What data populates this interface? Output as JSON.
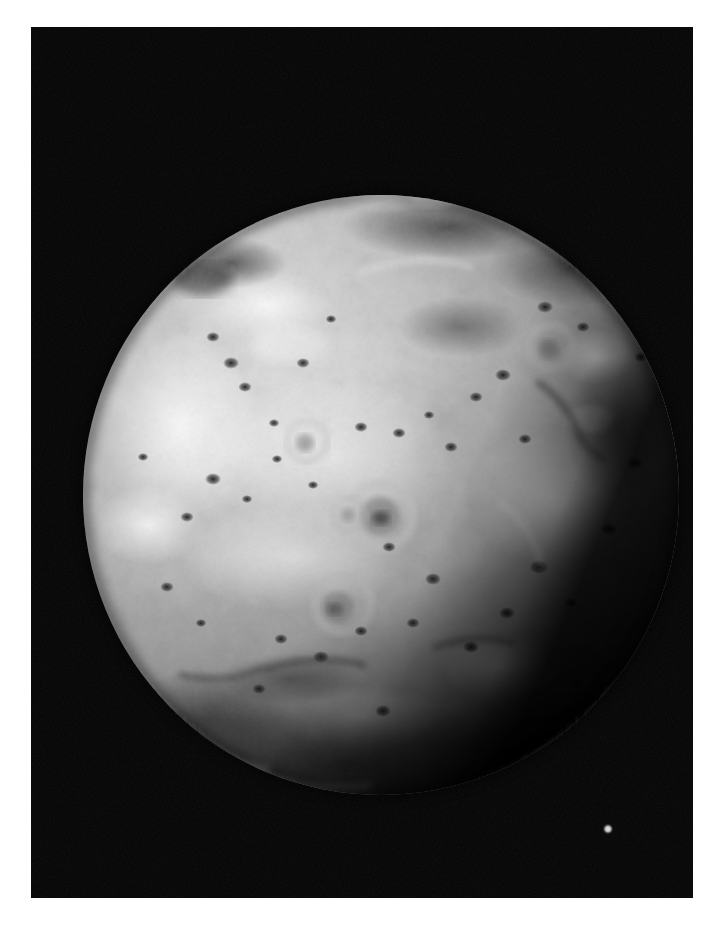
{
  "page": {
    "background_color": "#ffffff",
    "width": 722,
    "height": 926
  },
  "photo": {
    "name": "io-volcanic-moon-photograph",
    "kind": "grayscale-spacecraft-image",
    "frame": {
      "x": 31,
      "y": 27,
      "width": 662,
      "height": 871
    },
    "background_color": "#050505",
    "subject": "Io",
    "alt_text": "Grayscale spacecraft photograph of Jupiter's moon Io against black space"
  },
  "body": {
    "name": "io-disk",
    "center_x": 350,
    "center_y": 468,
    "radius_x": 298,
    "radius_y": 300,
    "base_color": "#b9b9b9",
    "highlight_color": "#e9e9e9",
    "midtone_color": "#9a9a9a",
    "shadow_color": "#3a3a3a",
    "limb_color": "#171717"
  },
  "features": {
    "bright_patches": [
      {
        "name": "north-polar-bright-patch",
        "cx": 352,
        "cy": 165,
        "rx": 42,
        "ry": 17,
        "tone": "#efefef"
      },
      {
        "name": "northwest-bright-plain",
        "cx": 236,
        "cy": 278,
        "rx": 58,
        "ry": 30,
        "tone": "#e6e6e6"
      },
      {
        "name": "west-bright-terrain",
        "cx": 150,
        "cy": 400,
        "rx": 70,
        "ry": 85,
        "tone": "#e4e4e4"
      },
      {
        "name": "west-bright-streak",
        "cx": 120,
        "cy": 498,
        "rx": 46,
        "ry": 34,
        "tone": "#e8e8e8"
      },
      {
        "name": "central-bright-plain",
        "cx": 300,
        "cy": 430,
        "rx": 120,
        "ry": 70,
        "tone": "#dedede"
      },
      {
        "name": "central-lower-bright",
        "cx": 262,
        "cy": 530,
        "rx": 108,
        "ry": 48,
        "tone": "#dcdcdc"
      },
      {
        "name": "east-bright-region",
        "cx": 520,
        "cy": 470,
        "rx": 72,
        "ry": 62,
        "tone": "#e2e2e2"
      },
      {
        "name": "east-bright-spur",
        "cx": 565,
        "cy": 330,
        "rx": 30,
        "ry": 24,
        "tone": "#e0e0e0"
      },
      {
        "name": "southeast-bright-patch",
        "cx": 470,
        "cy": 640,
        "rx": 52,
        "ry": 30,
        "tone": "#d8d8d8"
      },
      {
        "name": "south-bright-rim",
        "cx": 330,
        "cy": 690,
        "rx": 76,
        "ry": 28,
        "tone": "#cccccc"
      }
    ],
    "dark_patches": [
      {
        "name": "northwest-dark-terrain",
        "cx": 200,
        "cy": 236,
        "rx": 48,
        "ry": 22,
        "tone": "#3c3c3c"
      },
      {
        "name": "north-dark-band",
        "cx": 420,
        "cy": 200,
        "rx": 96,
        "ry": 26,
        "tone": "#585858"
      },
      {
        "name": "northeast-dark-mottling",
        "cx": 540,
        "cy": 240,
        "rx": 70,
        "ry": 34,
        "tone": "#4e4e4e"
      },
      {
        "name": "east-dark-band",
        "cx": 585,
        "cy": 400,
        "rx": 44,
        "ry": 60,
        "tone": "#555555"
      },
      {
        "name": "south-terminator-shading",
        "cx": 320,
        "cy": 730,
        "rx": 180,
        "ry": 60,
        "tone": "#2a2a2a"
      },
      {
        "name": "southeast-dark-shading",
        "cx": 500,
        "cy": 720,
        "rx": 110,
        "ry": 50,
        "tone": "#3a3a3a"
      },
      {
        "name": "southwest-dark-shading",
        "cx": 175,
        "cy": 690,
        "rx": 80,
        "ry": 46,
        "tone": "#4a4a4a"
      }
    ],
    "volcanic_rings": [
      {
        "name": "prometheus-ring",
        "cx": 349,
        "cy": 489,
        "r_outer": 32,
        "r_inner": 17,
        "ring_tone": "#d2d2d2",
        "core_tone": "#5e5e5e"
      },
      {
        "name": "secondary-ring-southwest",
        "cx": 312,
        "cy": 577,
        "r_outer": 28,
        "r_inner": 14,
        "ring_tone": "#cacaca",
        "core_tone": "#6a6a6a"
      },
      {
        "name": "ring-northwest",
        "cx": 276,
        "cy": 414,
        "r_outer": 20,
        "r_inner": 9,
        "ring_tone": "#c8c8c8",
        "core_tone": "#777777"
      },
      {
        "name": "ring-east",
        "cx": 520,
        "cy": 320,
        "r_outer": 22,
        "r_inner": 10,
        "ring_tone": "#c6c6c6",
        "core_tone": "#6f6f6f"
      },
      {
        "name": "ring-southcentral",
        "cx": 318,
        "cy": 487,
        "r_outer": 16,
        "r_inner": 7,
        "ring_tone": "#c4c4c4",
        "core_tone": "#7c7c7c"
      }
    ],
    "dark_spots": [
      {
        "cx": 200,
        "cy": 336,
        "r": 6
      },
      {
        "cx": 214,
        "cy": 360,
        "r": 5
      },
      {
        "cx": 182,
        "cy": 310,
        "r": 5
      },
      {
        "cx": 243,
        "cy": 396,
        "r": 4
      },
      {
        "cx": 272,
        "cy": 336,
        "r": 5
      },
      {
        "cx": 300,
        "cy": 292,
        "r": 4
      },
      {
        "cx": 182,
        "cy": 452,
        "r": 6
      },
      {
        "cx": 156,
        "cy": 490,
        "r": 5
      },
      {
        "cx": 216,
        "cy": 472,
        "r": 4
      },
      {
        "cx": 246,
        "cy": 432,
        "r": 4
      },
      {
        "cx": 282,
        "cy": 458,
        "r": 4
      },
      {
        "cx": 330,
        "cy": 400,
        "r": 5
      },
      {
        "cx": 368,
        "cy": 406,
        "r": 5
      },
      {
        "cx": 398,
        "cy": 388,
        "r": 4
      },
      {
        "cx": 420,
        "cy": 420,
        "r": 5
      },
      {
        "cx": 445,
        "cy": 370,
        "r": 5
      },
      {
        "cx": 472,
        "cy": 348,
        "r": 6
      },
      {
        "cx": 494,
        "cy": 412,
        "r": 5
      },
      {
        "cx": 514,
        "cy": 280,
        "r": 6
      },
      {
        "cx": 552,
        "cy": 300,
        "r": 5
      },
      {
        "cx": 582,
        "cy": 252,
        "r": 5
      },
      {
        "cx": 610,
        "cy": 330,
        "r": 5
      },
      {
        "cx": 358,
        "cy": 520,
        "r": 5
      },
      {
        "cx": 402,
        "cy": 552,
        "r": 6
      },
      {
        "cx": 382,
        "cy": 596,
        "r": 5
      },
      {
        "cx": 330,
        "cy": 604,
        "r": 5
      },
      {
        "cx": 290,
        "cy": 630,
        "r": 6
      },
      {
        "cx": 250,
        "cy": 612,
        "r": 5
      },
      {
        "cx": 440,
        "cy": 620,
        "r": 6
      },
      {
        "cx": 476,
        "cy": 586,
        "r": 6
      },
      {
        "cx": 508,
        "cy": 540,
        "r": 7
      },
      {
        "cx": 540,
        "cy": 576,
        "r": 5
      },
      {
        "cx": 578,
        "cy": 502,
        "r": 6
      },
      {
        "cx": 604,
        "cy": 436,
        "r": 6
      },
      {
        "cx": 136,
        "cy": 560,
        "r": 5
      },
      {
        "cx": 170,
        "cy": 596,
        "r": 4
      },
      {
        "cx": 112,
        "cy": 430,
        "r": 4
      },
      {
        "cx": 228,
        "cy": 662,
        "r": 5
      },
      {
        "cx": 352,
        "cy": 684,
        "r": 6
      },
      {
        "cx": 546,
        "cy": 656,
        "r": 5
      }
    ],
    "star": {
      "name": "background-star",
      "cx": 577,
      "cy": 802,
      "r": 3.5,
      "tone": "#cfcfcf"
    }
  },
  "chart_data": {
    "type": "table",
    "categories": [
      "disk_left",
      "disk_right",
      "disk_top",
      "disk_bottom"
    ],
    "values": [
      53,
      645,
      140,
      800
    ]
  }
}
